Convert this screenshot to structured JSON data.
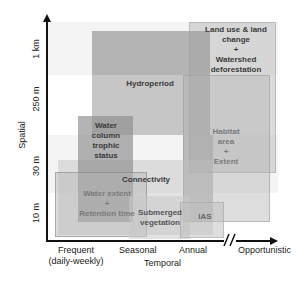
{
  "diagram": {
    "x_axis": {
      "title": "Temporal",
      "ticks": [
        "Frequent\n(daily-weekly)",
        "Seasonal",
        "Annual",
        "Opportunistic"
      ],
      "break_marker": "//"
    },
    "y_axis": {
      "title": "Spatial",
      "ticks": [
        "10 m",
        "30 m",
        "250 m",
        "1 km"
      ]
    },
    "boxes": [
      {
        "id": "hydroperiod",
        "label": "Hydroperiod"
      },
      {
        "id": "land-use",
        "label": "Land use & land\nchange\n+\nWatershed\ndeforestation"
      },
      {
        "id": "habitat",
        "label": "Habitat\narea\n+\nExtent"
      },
      {
        "id": "water-column",
        "label": "Water\ncolumn\ntrophic\nstatus"
      },
      {
        "id": "connectivity",
        "label": "Connectivity"
      },
      {
        "id": "water-extent",
        "label": "Water extent\n+\nRetention time"
      },
      {
        "id": "submerged-veg",
        "label": "Submerged\nvegetation"
      },
      {
        "id": "ias",
        "label": "IAS"
      }
    ],
    "colors": {
      "box_dark": "#a8a8a8",
      "box_mid": "#bdbdbd",
      "box_light": "#d6d6d6",
      "band": "#efefef",
      "axis": "#111111",
      "text_dark": "#3a3a3a",
      "text_light": "#7a7a7a"
    }
  }
}
